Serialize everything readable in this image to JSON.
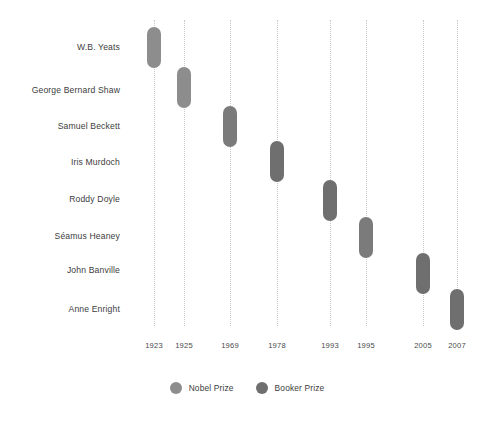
{
  "chart_data": {
    "type": "bar",
    "orientation": "timeline",
    "title": "",
    "subtitle": "",
    "xlabel": "",
    "ylabel": "",
    "grid": true,
    "legend_position": "bottom-center",
    "categories": [
      "W.B. Yeats",
      "George Bernard Shaw",
      "Samuel Beckett",
      "Iris Murdoch",
      "Roddy Doyle",
      "Séamus Heaney",
      "John Banville",
      "Anne Enright"
    ],
    "x_tick_labels": [
      "1923",
      "1925",
      "1969",
      "1978",
      "1993",
      "1995",
      "2005",
      "2007"
    ],
    "x_tick_positions": [
      154,
      184,
      230,
      277,
      330,
      366,
      423,
      457
    ],
    "values": [
      1923,
      1925,
      1969,
      1978,
      1993,
      1995,
      2005,
      2007
    ],
    "series": [
      {
        "name": "Nobel Prize",
        "color": "#8d8d8d",
        "values": [
          1923,
          1925,
          1969,
          null,
          null,
          1995,
          null,
          null
        ]
      },
      {
        "name": "Booker Prize",
        "color": "#6f6f6f",
        "values": [
          null,
          null,
          null,
          1978,
          1993,
          null,
          2005,
          2007
        ]
      }
    ],
    "points": [
      {
        "label": "W.B. Yeats",
        "year": 1923,
        "prize": "Nobel Prize",
        "x": 154,
        "y": 47,
        "color": "#8d8d8d"
      },
      {
        "label": "George Bernard Shaw",
        "year": 1925,
        "prize": "Nobel Prize",
        "x": 184,
        "y": 87,
        "color": "#8d8d8d"
      },
      {
        "label": "Samuel Beckett",
        "year": 1969,
        "prize": "Nobel Prize",
        "x": 230,
        "y": 126,
        "color": "#7b7b7b"
      },
      {
        "label": "Iris Murdoch",
        "year": 1978,
        "prize": "Booker Prize",
        "x": 277,
        "y": 161,
        "color": "#6f6f6f"
      },
      {
        "label": "Roddy Doyle",
        "year": 1993,
        "prize": "Booker Prize",
        "x": 330,
        "y": 200,
        "color": "#6f6f6f"
      },
      {
        "label": "Séamus Heaney",
        "year": 1995,
        "prize": "Nobel Prize",
        "x": 366,
        "y": 237,
        "color": "#7b7b7b"
      },
      {
        "label": "John Banville",
        "year": 2005,
        "prize": "Booker Prize",
        "x": 423,
        "y": 273,
        "color": "#6f6f6f"
      },
      {
        "label": "Anne Enright",
        "year": 2007,
        "prize": "Booker Prize",
        "x": 457,
        "y": 309,
        "color": "#6f6f6f"
      }
    ],
    "row_label_y": [
      47,
      90,
      126,
      162,
      199,
      236,
      270,
      309
    ]
  },
  "legend": {
    "items": [
      {
        "label": "Nobel Prize",
        "color": "#8d8d8d"
      },
      {
        "label": "Booker Prize",
        "color": "#6f6f6f"
      }
    ]
  },
  "colors": {
    "background": "#ffffff",
    "gridline": "#c9c9c9",
    "text": "#3d3d3d",
    "tick_text": "#4a4a4a",
    "nobel": "#8d8d8d",
    "booker": "#6f6f6f"
  }
}
